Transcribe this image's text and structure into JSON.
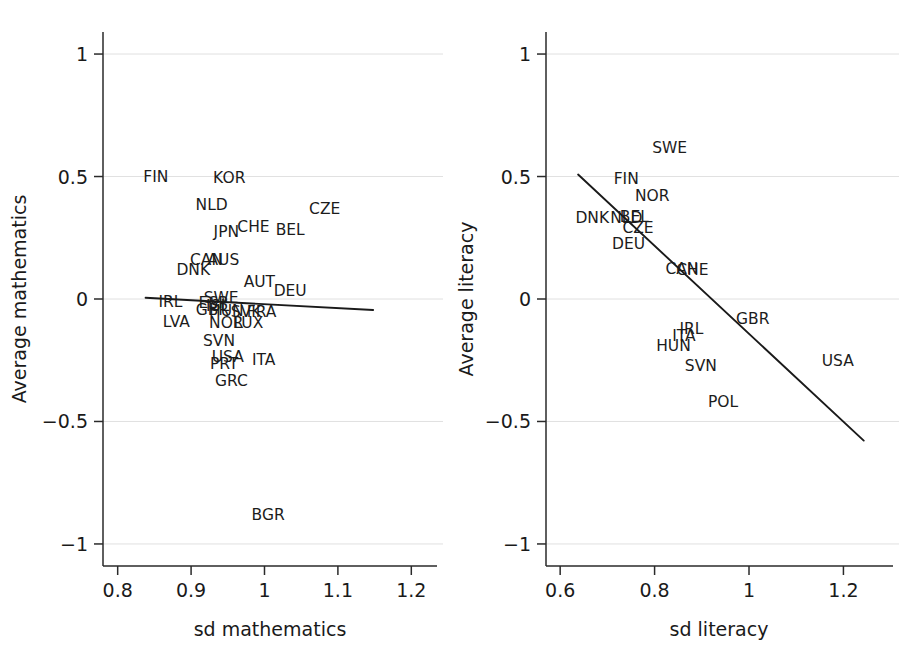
{
  "chart_data": [
    {
      "type": "scatter",
      "panel": "left",
      "title": "",
      "xlabel": "sd mathematics",
      "ylabel": "Average mathematics",
      "xlim": [
        0.78,
        1.235
      ],
      "ylim": [
        -1.09,
        1.09
      ],
      "xticks": [
        "0.8",
        "0.9",
        "1",
        "1.1",
        "1.2"
      ],
      "xtick_values": [
        0.8,
        0.9,
        1.0,
        1.1,
        1.2
      ],
      "yticks": [
        "1",
        "0.5",
        "0",
        "-0.5",
        "-1"
      ],
      "ytick_values": [
        1,
        0.5,
        0,
        -0.5,
        -1
      ],
      "grid": "horizontal",
      "legend": "none",
      "fit_line": {
        "x0": 0.838,
        "y0": 0.005,
        "x1": 1.148,
        "y1": -0.045
      },
      "points": [
        {
          "label": "FIN",
          "x": 0.852,
          "y": 0.498
        },
        {
          "label": "KOR",
          "x": 0.952,
          "y": 0.493
        },
        {
          "label": "NLD",
          "x": 0.928,
          "y": 0.385
        },
        {
          "label": "CZE",
          "x": 1.082,
          "y": 0.368
        },
        {
          "label": "JPN",
          "x": 0.948,
          "y": 0.272
        },
        {
          "label": "CHE",
          "x": 0.985,
          "y": 0.292
        },
        {
          "label": "BEL",
          "x": 1.035,
          "y": 0.282
        },
        {
          "label": "CAN",
          "x": 0.921,
          "y": 0.16
        },
        {
          "label": "AUS",
          "x": 0.944,
          "y": 0.158
        },
        {
          "label": "DNK",
          "x": 0.903,
          "y": 0.118
        },
        {
          "label": "AUT",
          "x": 0.993,
          "y": 0.068
        },
        {
          "label": "DEU",
          "x": 1.035,
          "y": 0.033
        },
        {
          "label": "IRL",
          "x": 0.872,
          "y": -0.012
        },
        {
          "label": "SWE",
          "x": 0.941,
          "y": 0.003
        },
        {
          "label": "ESP",
          "x": 0.93,
          "y": -0.018
        },
        {
          "label": "ISL",
          "x": 0.936,
          "y": -0.028
        },
        {
          "label": "GBR",
          "x": 0.929,
          "y": -0.045
        },
        {
          "label": "HUN",
          "x": 0.948,
          "y": -0.05
        },
        {
          "label": "SVK",
          "x": 0.975,
          "y": -0.055
        },
        {
          "label": "FRA",
          "x": 0.996,
          "y": -0.052
        },
        {
          "label": "LVA",
          "x": 0.88,
          "y": -0.095
        },
        {
          "label": "NOR",
          "x": 0.948,
          "y": -0.098
        },
        {
          "label": "LUX",
          "x": 0.978,
          "y": -0.098
        },
        {
          "label": "SVN",
          "x": 0.938,
          "y": -0.17
        },
        {
          "label": "USA",
          "x": 0.95,
          "y": -0.237
        },
        {
          "label": "PRT",
          "x": 0.945,
          "y": -0.265
        },
        {
          "label": "ITA",
          "x": 0.999,
          "y": -0.25
        },
        {
          "label": "GRC",
          "x": 0.955,
          "y": -0.335
        },
        {
          "label": "BGR",
          "x": 1.005,
          "y": -0.88
        }
      ]
    },
    {
      "type": "scatter",
      "panel": "right",
      "title": "",
      "xlabel": "sd literacy",
      "ylabel": "Average literacy",
      "xlim": [
        0.57,
        1.305
      ],
      "ylim": [
        -1.09,
        1.09
      ],
      "xticks": [
        "0.6",
        "0.8",
        "1",
        "1.2"
      ],
      "xtick_values": [
        0.6,
        0.8,
        1.0,
        1.2
      ],
      "yticks": [
        "1",
        "0.5",
        "0",
        "-0.5",
        "-1"
      ],
      "ytick_values": [
        1,
        0.5,
        0,
        -0.5,
        -1
      ],
      "grid": "horizontal",
      "legend": "none",
      "fit_line": {
        "x0": 0.638,
        "y0": 0.508,
        "x1": 1.243,
        "y1": -0.578
      },
      "points": [
        {
          "label": "SWE",
          "x": 0.832,
          "y": 0.618
        },
        {
          "label": "FIN",
          "x": 0.74,
          "y": 0.49
        },
        {
          "label": "NOR",
          "x": 0.795,
          "y": 0.42
        },
        {
          "label": "DNK",
          "x": 0.668,
          "y": 0.33
        },
        {
          "label": "NLD",
          "x": 0.74,
          "y": 0.332
        },
        {
          "label": "BEL",
          "x": 0.757,
          "y": 0.333
        },
        {
          "label": "CZE",
          "x": 0.765,
          "y": 0.29
        },
        {
          "label": "DEU",
          "x": 0.745,
          "y": 0.225
        },
        {
          "label": "CAN",
          "x": 0.858,
          "y": 0.122
        },
        {
          "label": "CHE",
          "x": 0.88,
          "y": 0.118
        },
        {
          "label": "GBR",
          "x": 1.008,
          "y": -0.082
        },
        {
          "label": "IRL",
          "x": 0.878,
          "y": -0.122
        },
        {
          "label": "ITA",
          "x": 0.862,
          "y": -0.152
        },
        {
          "label": "HUN",
          "x": 0.84,
          "y": -0.192
        },
        {
          "label": "SVN",
          "x": 0.898,
          "y": -0.272
        },
        {
          "label": "USA",
          "x": 1.188,
          "y": -0.252
        },
        {
          "label": "POL",
          "x": 0.945,
          "y": -0.422
        }
      ]
    }
  ]
}
